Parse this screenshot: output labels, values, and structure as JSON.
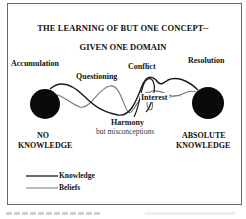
{
  "diagram": {
    "title_line1": "THE LEARNING OF BUT ONE CONCEPT--",
    "title_line2": "GIVEN ONE DOMAIN",
    "stages": {
      "accumulation": "Accumulation",
      "questioning": "Questioning",
      "conflict": "Conflict",
      "resolution": "Resolution",
      "interest": "Interest",
      "harmony": "Harmony",
      "harmony_note": "but misconceptions"
    },
    "endpoints": {
      "start_line1": "NO",
      "start_line2": "KNOWLEDGE",
      "end_line1": "ABSOLUTE",
      "end_line2": "KNOWLEDGE"
    },
    "legend": [
      {
        "label": "Knowledge",
        "color": "#1a1a1a",
        "style": "solid-dark"
      },
      {
        "label": "Beliefs",
        "color": "#777777",
        "style": "solid-light"
      }
    ],
    "colors": {
      "frame": "#6a6a6a",
      "node_fill": "#0a0a0a",
      "knowledge_line": "#1a1a1a",
      "beliefs_line": "#777777"
    }
  }
}
